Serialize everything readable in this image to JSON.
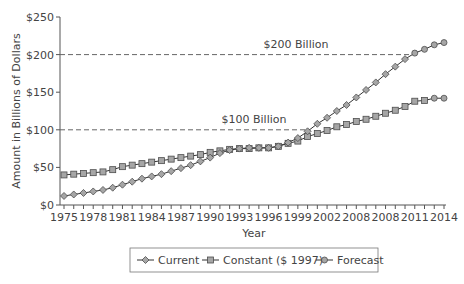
{
  "chart_data": {
    "type": "line",
    "title": "",
    "xlabel": "Year",
    "ylabel": "Amount in Billions of Dollars",
    "ylim": [
      0,
      250
    ],
    "xlim": [
      1975,
      2014
    ],
    "grid": false,
    "legend_position": "bottom",
    "y_ticks": [
      "$0",
      "$50",
      "$100",
      "$150",
      "$200",
      "$250"
    ],
    "y_tick_values": [
      0,
      50,
      100,
      150,
      200,
      250
    ],
    "x_tick_labels": [
      "1975",
      "1978",
      "1981",
      "1984",
      "1987",
      "1990",
      "1993",
      "1996",
      "1999",
      "2002",
      "2008",
      "2008",
      "2011",
      "2014"
    ],
    "x": [
      1975,
      1976,
      1977,
      1978,
      1979,
      1980,
      1981,
      1982,
      1983,
      1984,
      1985,
      1986,
      1987,
      1988,
      1989,
      1990,
      1991,
      1992,
      1993,
      1994,
      1995,
      1996,
      1997,
      1998,
      1999,
      2000,
      2001,
      2002,
      2003,
      2004,
      2005,
      2006,
      2007,
      2008,
      2009,
      2010,
      2011,
      2012,
      2013,
      2014
    ],
    "series": [
      {
        "name": "Current",
        "marker": "diamond",
        "x": [
          1975,
          1976,
          1977,
          1978,
          1979,
          1980,
          1981,
          1982,
          1983,
          1984,
          1985,
          1986,
          1987,
          1988,
          1989,
          1990,
          1991,
          1992,
          1993,
          1994,
          1995,
          1996,
          1997,
          1998,
          1999,
          2000,
          2001,
          2002,
          2003,
          2004,
          2005,
          2006,
          2007,
          2008,
          2009,
          2010
        ],
        "values": [
          12,
          14,
          16,
          18,
          20,
          23,
          27,
          31,
          35,
          38,
          41,
          45,
          49,
          53,
          58,
          63,
          69,
          73,
          75,
          76,
          76,
          76,
          78,
          83,
          89,
          98,
          108,
          116,
          125,
          133,
          143,
          153,
          163,
          174,
          184,
          194
        ]
      },
      {
        "name": "Constant ($ 1997)",
        "marker": "square",
        "x": [
          1975,
          1976,
          1977,
          1978,
          1979,
          1980,
          1981,
          1982,
          1983,
          1984,
          1985,
          1986,
          1987,
          1988,
          1989,
          1990,
          1991,
          1992,
          1993,
          1994,
          1995,
          1996,
          1997,
          1998,
          1999,
          2000,
          2001,
          2002,
          2003,
          2004,
          2005,
          2006,
          2007,
          2008,
          2009,
          2010,
          2011,
          2012
        ],
        "values": [
          40,
          41,
          42,
          43,
          44,
          47,
          51,
          53,
          55,
          57,
          59,
          61,
          63,
          65,
          67,
          70,
          72,
          74,
          75,
          75,
          76,
          76,
          78,
          82,
          85,
          91,
          95,
          99,
          104,
          107,
          111,
          114,
          118,
          122,
          126,
          131,
          138,
          139
        ]
      },
      {
        "name": "Forecast",
        "marker": "circle",
        "x": [
          2010,
          2011,
          2012,
          2013,
          2014
        ],
        "values_current": [
          194,
          202,
          207,
          213,
          216
        ],
        "values_constant": [
          138,
          140,
          141,
          142,
          142
        ]
      }
    ],
    "annotations": [
      {
        "text": "$200 Billion",
        "y": 200,
        "style": "dashed-line"
      },
      {
        "text": "$100 Billion",
        "y": 100,
        "style": "dashed-line"
      }
    ]
  },
  "labels": {
    "ylabel": "Amount in Billions of Dollars",
    "xlabel": "Year",
    "ref200": "$200 Billion",
    "ref100": "$100 Billion",
    "legend_current": "Current",
    "legend_constant": "Constant ($ 1997)",
    "legend_forecast": "Forecast"
  },
  "colors": {
    "line": "#333333",
    "marker_fill": "#a6a6a6",
    "marker_stroke": "#4d4d4d",
    "dashed": "#666666",
    "axis": "#555555"
  }
}
